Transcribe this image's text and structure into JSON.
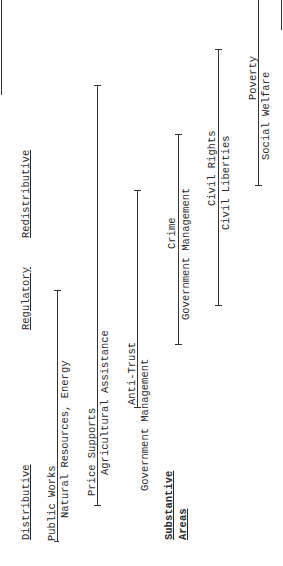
{
  "orientation": "rotated-90-ccw",
  "categories": {
    "distributive": "Distributive",
    "regulatory": "Regulatory",
    "redistributive": "Redistributive"
  },
  "axis_label": {
    "line1": "Substantive",
    "line2": "Areas"
  },
  "areas": [
    {
      "label": "Public Works"
    },
    {
      "label": "Natural Resources, Energy"
    },
    {
      "label": "Price Supports"
    },
    {
      "label": "Agricultural Assistance"
    },
    {
      "label": "Anti-Trust"
    },
    {
      "label": "Government Management"
    },
    {
      "label": "Crime"
    },
    {
      "label": "Government Management"
    },
    {
      "label": "Civil Rights"
    },
    {
      "label": "Civil Liberties"
    },
    {
      "label": "Poverty"
    },
    {
      "label": "Social Welfare"
    }
  ]
}
